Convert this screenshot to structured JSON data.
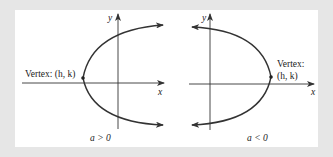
{
  "diagram": {
    "background_color": "#e6e6e6",
    "panel_color": "#ffffff",
    "stroke_color": "#333333",
    "left": {
      "y_axis_label": "y",
      "x_axis_label": "x",
      "vertex_label": "Vertex: (h, k)",
      "caption": "a > 0",
      "opens": "right"
    },
    "right": {
      "y_axis_label": "y",
      "x_axis_label": "x",
      "vertex_label_line1": "Vertex:",
      "vertex_label_line2": "(h, k)",
      "caption": "a < 0",
      "opens": "left"
    }
  }
}
